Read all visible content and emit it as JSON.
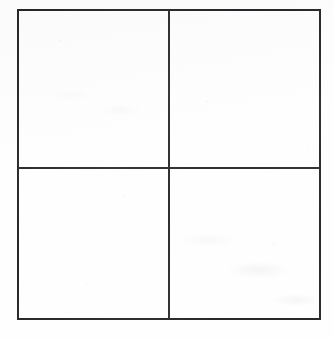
{
  "figure": {
    "name": "blank-quadrant-grid",
    "kind": "2x2 grid",
    "rows": 2,
    "columns": 2,
    "line_color": "#2b2b2d",
    "background_color": "#fefefe",
    "border_width_px": 2,
    "frame": {
      "left_px": 17,
      "top_px": 9,
      "width_px": 304,
      "height_px": 311
    },
    "dividers": {
      "vertical_x_px": 169,
      "horizontal_y_px": 167
    }
  },
  "cells": [
    {
      "id": "top-left",
      "row": 1,
      "column": 1,
      "text": ""
    },
    {
      "id": "top-right",
      "row": 1,
      "column": 2,
      "text": ""
    },
    {
      "id": "bottom-left",
      "row": 2,
      "column": 1,
      "text": ""
    },
    {
      "id": "bottom-right",
      "row": 2,
      "column": 2,
      "text": ""
    }
  ]
}
